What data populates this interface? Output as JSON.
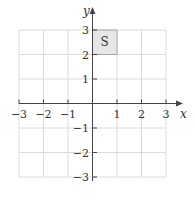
{
  "figure": {
    "type": "coordinate-grid",
    "x_axis": {
      "label": "x",
      "min": -3,
      "max": 3,
      "tick_labels": [
        "−3",
        "−2",
        "−1",
        "1",
        "2",
        "3"
      ],
      "tick_values": [
        -3,
        -2,
        -1,
        1,
        2,
        3
      ]
    },
    "y_axis": {
      "label": "y",
      "min": -3,
      "max": 3,
      "tick_labels": [
        "3",
        "2",
        "1",
        "−1",
        "−2",
        "−3"
      ],
      "tick_values": [
        3,
        2,
        1,
        -1,
        -2,
        -3
      ]
    },
    "shaded_region": {
      "label": "S",
      "x_range": [
        0,
        1
      ],
      "y_range": [
        2,
        3
      ],
      "fill": "#e6e6e6"
    },
    "colors": {
      "grid": "#dcdcdc",
      "axis": "#444444",
      "text": "#333333"
    }
  }
}
